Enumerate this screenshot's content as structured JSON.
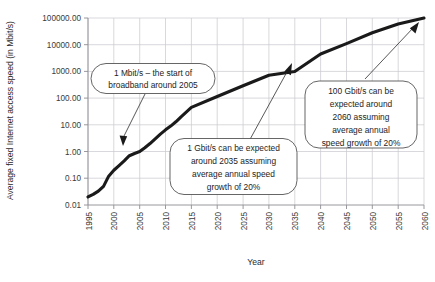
{
  "chart_data": {
    "type": "line",
    "title": "",
    "xlabel": "Year",
    "ylabel": "Average fixed Internet access speed (in Mbit/s)",
    "yscale": "log",
    "ylim": [
      0.01,
      100000
    ],
    "xlim": [
      1995,
      2060
    ],
    "grid": true,
    "legend": "none",
    "ytick_labels": [
      "100000.00",
      "10000.00",
      "1000.00",
      "100.00",
      "10.00",
      "1.00",
      "0.10",
      "0.01"
    ],
    "ytick_values": [
      100000,
      10000,
      1000,
      100,
      10,
      1,
      0.1,
      0.01
    ],
    "xtick_labels": [
      "1995",
      "2000",
      "2005",
      "2010",
      "2015",
      "2020",
      "2025",
      "2030",
      "2035",
      "2040",
      "2045",
      "2050",
      "2055",
      "2060"
    ],
    "xtick_values": [
      1995,
      2000,
      2005,
      2010,
      2015,
      2020,
      2025,
      2030,
      2035,
      2040,
      2045,
      2050,
      2055,
      2060
    ],
    "series": [
      {
        "name": "Average fixed Internet access speed",
        "x": [
          1995,
          1996,
          1997,
          1998,
          1999,
          2000,
          2001,
          2002,
          2003,
          2004,
          2005,
          2006,
          2007,
          2008,
          2009,
          2010,
          2011,
          2012,
          2013,
          2014,
          2015,
          2020,
          2025,
          2030,
          2035,
          2040,
          2045,
          2050,
          2055,
          2060
        ],
        "y": [
          0.02,
          0.025,
          0.033,
          0.05,
          0.12,
          0.2,
          0.3,
          0.45,
          0.7,
          0.85,
          1.0,
          1.4,
          2.0,
          3.0,
          4.5,
          6.5,
          9.0,
          13.0,
          20.0,
          30.0,
          45.0,
          115.0,
          290.0,
          720.0,
          1000.0,
          4500.0,
          11000.0,
          28000.0,
          60000.0,
          100000.0
        ],
        "color": "#1a1a1a",
        "linewidth": 3.1
      }
    ],
    "annotations": [
      {
        "id": "annotation-1mbit",
        "text_lines": [
          "1 Mbit/s – the start of",
          "broadband around 2005"
        ],
        "points_to_year": 2005,
        "points_to_value": 1.0
      },
      {
        "id": "annotation-1gbit",
        "text_lines": [
          "1 Gbit/s can be expected",
          "around 2035 assuming",
          "average annual speed",
          "growth of 20%"
        ],
        "points_to_year": 2035,
        "points_to_value": 1000.0
      },
      {
        "id": "annotation-100gbit",
        "text_lines": [
          "100 Gbit/s can be",
          "expected around",
          "2060 assuming",
          "average annual",
          "speed growth of 20%"
        ],
        "points_to_year": 2060,
        "points_to_value": 100000.0
      }
    ]
  },
  "colors": {
    "line": "#1a1a1a",
    "grid": "#c9c9cf",
    "axis": "#8d8d93",
    "callout_border": "#4a4a4a",
    "background": "#ffffff"
  }
}
